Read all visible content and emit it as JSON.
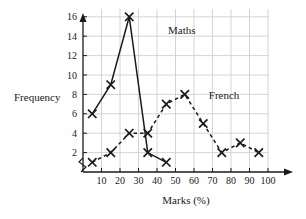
{
  "chart_data": {
    "type": "line",
    "title": "",
    "xlabel": "Marks (%)",
    "ylabel": "Frequency",
    "xlim": [
      0,
      100
    ],
    "ylim": [
      0,
      17
    ],
    "grid": true,
    "xticks": [
      10,
      20,
      30,
      40,
      50,
      60,
      70,
      80,
      90,
      100
    ],
    "yticks": [
      2,
      4,
      6,
      8,
      10,
      12,
      14,
      16
    ],
    "legend_position": "inline-annotation",
    "axis_break": "y-axis zigzag near origin",
    "marker": "x-cross",
    "series": [
      {
        "name": "Maths",
        "linestyle": "solid",
        "color": "#1a1a1a",
        "x": [
          5,
          15,
          25,
          35,
          45
        ],
        "values": [
          6,
          9,
          16,
          2,
          1
        ],
        "label_x": 46,
        "label_y": 14.2
      },
      {
        "name": "French",
        "linestyle": "dashed",
        "color": "#1a1a1a",
        "x": [
          5,
          15,
          25,
          35,
          45,
          55,
          65,
          75,
          85,
          95
        ],
        "values": [
          1,
          2,
          4,
          4,
          7,
          8,
          5,
          2,
          3,
          2
        ],
        "label_x": 68,
        "label_y": 7.5
      }
    ]
  },
  "axis": {
    "x_title": "Marks (%)",
    "y_title": "Frequency"
  },
  "ticks": {
    "x": [
      "10",
      "20",
      "30",
      "40",
      "50",
      "60",
      "70",
      "80",
      "90",
      "100"
    ],
    "y": [
      "2",
      "4",
      "6",
      "8",
      "10",
      "12",
      "14",
      "16"
    ]
  },
  "annotations": {
    "maths": "Maths",
    "french": "French"
  },
  "colors": {
    "ink": "#1a1a1a",
    "grid": "#c9c9c9",
    "background": "#ffffff"
  }
}
